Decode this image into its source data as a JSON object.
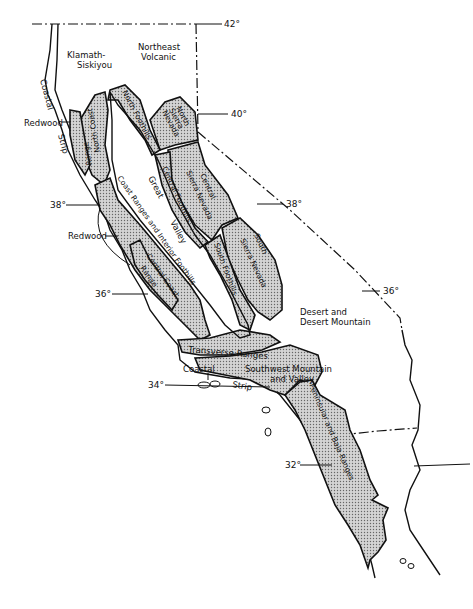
{
  "map": {
    "type": "regional map of California bioregions",
    "latitudes": [
      {
        "label": "42°",
        "x": 240,
        "y": 24
      },
      {
        "label": "40°",
        "x": 233,
        "y": 114
      },
      {
        "label": "38°",
        "x": 287,
        "y": 204
      },
      {
        "label": "38°",
        "x": 51,
        "y": 205
      },
      {
        "label": "36°",
        "x": 383,
        "y": 291
      },
      {
        "label": "36°",
        "x": 95,
        "y": 294
      },
      {
        "label": "34°",
        "x": 148,
        "y": 385
      },
      {
        "label": "32°",
        "x": 284,
        "y": 465
      }
    ],
    "regions": {
      "klamath": "Klamath-\nSiskiyou",
      "klamath_line1": "Klamath-",
      "klamath_line2": "Siskiyou",
      "northeast_line1": "Northeast",
      "northeast_line2": "Volcanic",
      "coastal_strip_north_1": "Coastal",
      "coastal_strip_north_2": "Strip",
      "redwood_north": "Redwood",
      "redwood_south": "Redwood",
      "north_foothills": "North Foothills",
      "north_sierra_1": "North",
      "north_sierra_2": "Sierra",
      "north_sierra_3": "Nevada",
      "north_coast_range_1": "North Coast",
      "north_coast_range_2": "Range",
      "coast_ranges": "Coast Ranges and Interior Foothills",
      "great_valley_1": "Great",
      "great_valley_2": "Valley",
      "central_foothills": "Central Foothills",
      "central_sierra_1": "Central",
      "central_sierra_2": "Sierra Nevada",
      "south_foothills": "South Foothills",
      "south_sierra_1": "South",
      "south_sierra_2": "Sierra Nevada",
      "central_coast_1": "Central Coast",
      "central_coast_2": "Range",
      "desert_1": "Desert and",
      "desert_2": "Desert Mountain",
      "transverse": "Transverse Ranges",
      "coastal_south_1": "Coastal",
      "coastal_south_2": "Strip",
      "southwest_1": "Southwest Mountain",
      "southwest_2": "and Valley",
      "peninsular": "Peninsular and Baja Ranges"
    }
  }
}
